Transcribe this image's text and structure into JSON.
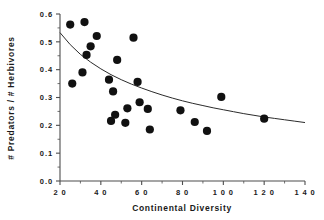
{
  "chart_data": {
    "type": "scatter",
    "title": "",
    "xlabel": "Continental  Diversity",
    "ylabel": "# Predators / # Herbivores",
    "xlim": [
      20,
      140
    ],
    "ylim": [
      0.0,
      0.6
    ],
    "grid": false,
    "legend": null,
    "x_ticks": [
      20,
      40,
      60,
      80,
      100,
      120,
      140
    ],
    "x_tick_labels": [
      "2 0",
      "4 0",
      "6 0",
      "8 0",
      "1 0 0",
      "1 2 0",
      "1 4 0"
    ],
    "x_minor_ticks": [
      30,
      50,
      70,
      90,
      110,
      130
    ],
    "y_ticks": [
      0.0,
      0.1,
      0.2,
      0.3,
      0.4,
      0.5,
      0.6
    ],
    "y_tick_labels": [
      "0.0",
      "0.1",
      "0.2",
      "0.3",
      "0.4",
      "0.5",
      "0.6"
    ],
    "y_minor_ticks": [
      0.05,
      0.15,
      0.25,
      0.35,
      0.45,
      0.55
    ],
    "marker": "filled-circle",
    "marker_color": "#111111",
    "marker_size": 4.1,
    "curve_color": "#2b2b2b",
    "points": [
      {
        "x": 25,
        "y": 0.562
      },
      {
        "x": 26,
        "y": 0.35
      },
      {
        "x": 31,
        "y": 0.39
      },
      {
        "x": 32,
        "y": 0.571
      },
      {
        "x": 33,
        "y": 0.453
      },
      {
        "x": 35,
        "y": 0.484
      },
      {
        "x": 38,
        "y": 0.521
      },
      {
        "x": 44,
        "y": 0.364
      },
      {
        "x": 45,
        "y": 0.216
      },
      {
        "x": 46,
        "y": 0.322
      },
      {
        "x": 47,
        "y": 0.238
      },
      {
        "x": 48,
        "y": 0.435
      },
      {
        "x": 52,
        "y": 0.209
      },
      {
        "x": 53,
        "y": 0.261
      },
      {
        "x": 56,
        "y": 0.515
      },
      {
        "x": 58,
        "y": 0.356
      },
      {
        "x": 59,
        "y": 0.283
      },
      {
        "x": 63,
        "y": 0.259
      },
      {
        "x": 64,
        "y": 0.185
      },
      {
        "x": 79,
        "y": 0.254
      },
      {
        "x": 86,
        "y": 0.212
      },
      {
        "x": 92,
        "y": 0.18
      },
      {
        "x": 99,
        "y": 0.302
      },
      {
        "x": 120,
        "y": 0.224
      }
    ],
    "fit_curve": {
      "description": "decreasing power-law fit",
      "points": [
        {
          "x": 20,
          "y": 0.533
        },
        {
          "x": 25,
          "y": 0.49
        },
        {
          "x": 30,
          "y": 0.455
        },
        {
          "x": 35,
          "y": 0.427
        },
        {
          "x": 40,
          "y": 0.403
        },
        {
          "x": 45,
          "y": 0.382
        },
        {
          "x": 50,
          "y": 0.364
        },
        {
          "x": 55,
          "y": 0.348
        },
        {
          "x": 60,
          "y": 0.334
        },
        {
          "x": 65,
          "y": 0.321
        },
        {
          "x": 70,
          "y": 0.309
        },
        {
          "x": 75,
          "y": 0.298
        },
        {
          "x": 80,
          "y": 0.288
        },
        {
          "x": 85,
          "y": 0.279
        },
        {
          "x": 90,
          "y": 0.271
        },
        {
          "x": 95,
          "y": 0.263
        },
        {
          "x": 100,
          "y": 0.256
        },
        {
          "x": 105,
          "y": 0.249
        },
        {
          "x": 110,
          "y": 0.242
        },
        {
          "x": 115,
          "y": 0.236
        },
        {
          "x": 120,
          "y": 0.23
        },
        {
          "x": 125,
          "y": 0.225
        },
        {
          "x": 130,
          "y": 0.22
        },
        {
          "x": 135,
          "y": 0.215
        },
        {
          "x": 140,
          "y": 0.21
        }
      ]
    }
  }
}
